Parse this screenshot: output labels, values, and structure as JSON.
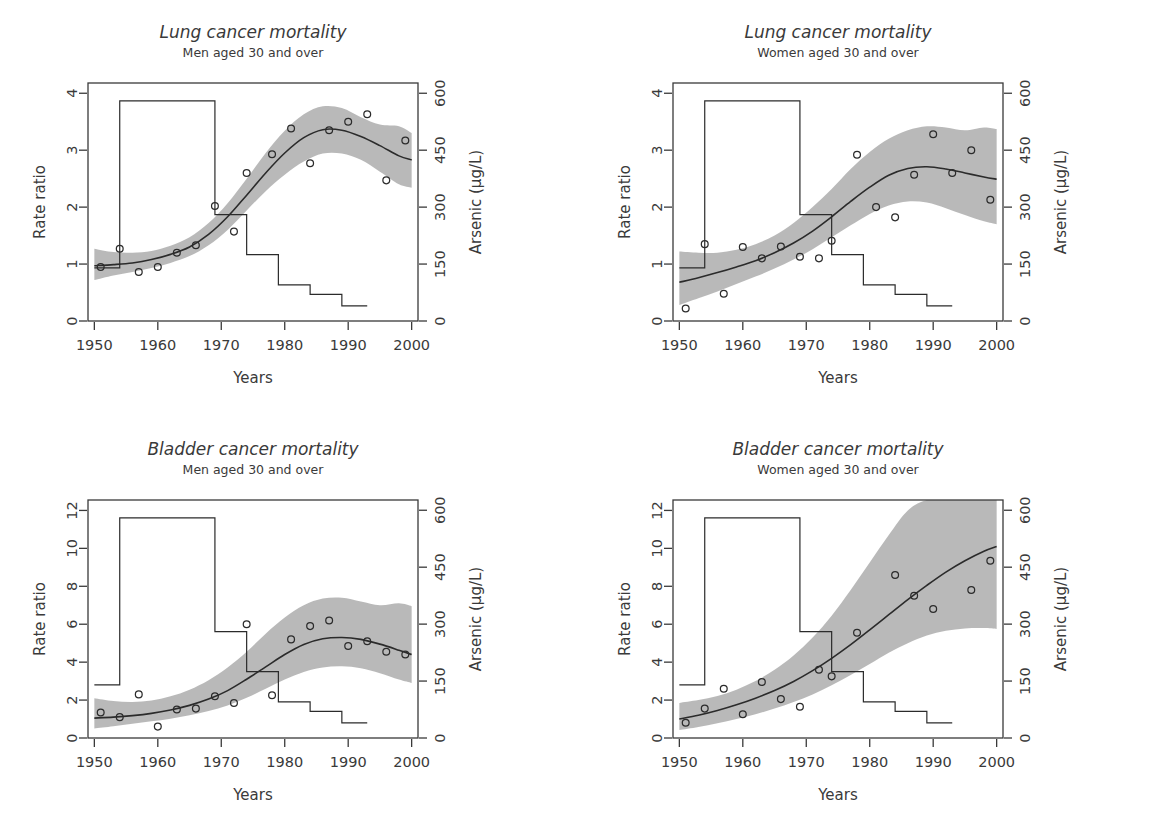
{
  "figure": {
    "background": "#ffffff",
    "band_color": "#b3b3b3",
    "line_color": "#2b2b2b",
    "text_color": "#3a3a3a",
    "width": 1169,
    "height": 834
  },
  "chart_data": [
    {
      "id": "lung-men",
      "type": "line",
      "title": "Lung cancer mortality",
      "subtitle": "Men aged 30 and over",
      "xlabel": "Years",
      "ylabel": "Rate ratio",
      "y2label": "Arsenic (µg/L)",
      "xlim": [
        1949,
        2001
      ],
      "ylim": [
        0,
        4.18
      ],
      "y2lim": [
        0,
        627
      ],
      "xticks": [
        1950,
        1960,
        1970,
        1980,
        1990,
        2000
      ],
      "yticks": [
        0,
        1,
        2,
        3,
        4
      ],
      "y2ticks": [
        0,
        150,
        300,
        450,
        600
      ],
      "grid": false,
      "legend": "none",
      "series": [
        {
          "name": "Observed rate ratio",
          "type": "scatter",
          "x": [
            1951,
            1954,
            1957,
            1960,
            1963,
            1966,
            1969,
            1972,
            1974,
            1978,
            1981,
            1984,
            1987,
            1990,
            1993,
            1996,
            1999
          ],
          "y": [
            0.95,
            1.27,
            0.86,
            0.95,
            1.2,
            1.33,
            2.02,
            1.57,
            2.6,
            2.93,
            3.38,
            2.77,
            3.35,
            3.5,
            3.63,
            2.47,
            3.17
          ]
        },
        {
          "name": "Fitted rate ratio",
          "type": "line",
          "x": [
            1950,
            1953,
            1956,
            1959,
            1962,
            1965,
            1968,
            1971,
            1974,
            1977,
            1980,
            1983,
            1986,
            1989,
            1992,
            1995,
            1998,
            2000
          ],
          "y": [
            0.97,
            0.99,
            1.02,
            1.08,
            1.17,
            1.3,
            1.52,
            1.83,
            2.21,
            2.6,
            2.95,
            3.22,
            3.36,
            3.35,
            3.24,
            3.08,
            2.9,
            2.83
          ]
        },
        {
          "name": "95% confidence band (upper)",
          "type": "band_upper",
          "x": [
            1950,
            1953,
            1956,
            1959,
            1962,
            1965,
            1968,
            1971,
            1974,
            1977,
            1980,
            1983,
            1986,
            1989,
            1992,
            1995,
            1998,
            2000
          ],
          "y": [
            1.27,
            1.21,
            1.2,
            1.23,
            1.32,
            1.47,
            1.72,
            2.07,
            2.5,
            2.95,
            3.34,
            3.63,
            3.77,
            3.74,
            3.58,
            3.45,
            3.42,
            3.3
          ]
        },
        {
          "name": "95% confidence band (lower)",
          "type": "band_lower",
          "x": [
            1950,
            1953,
            1956,
            1959,
            1962,
            1965,
            1968,
            1971,
            1974,
            1977,
            1980,
            1983,
            1986,
            1989,
            1992,
            1995,
            1998,
            2000
          ],
          "y": [
            0.72,
            0.8,
            0.86,
            0.93,
            1.02,
            1.14,
            1.33,
            1.6,
            1.94,
            2.28,
            2.57,
            2.8,
            2.94,
            2.94,
            2.83,
            2.62,
            2.4,
            2.34
          ]
        },
        {
          "name": "Arsenic concentration",
          "type": "step",
          "axis": "y2",
          "x": [
            1950,
            1954,
            1954,
            1969,
            1969,
            1974,
            1974,
            1979,
            1979,
            1984,
            1984,
            1989,
            1989,
            1993
          ],
          "y": [
            140,
            140,
            580,
            580,
            280,
            280,
            175,
            175,
            95,
            95,
            70,
            70,
            40,
            40
          ]
        }
      ]
    },
    {
      "id": "lung-women",
      "type": "line",
      "title": "Lung cancer mortality",
      "subtitle": "Women aged 30 and over",
      "xlabel": "Years",
      "ylabel": "Rate ratio",
      "y2label": "Arsenic (µg/L)",
      "xlim": [
        1949,
        2001
      ],
      "ylim": [
        0,
        4.18
      ],
      "y2lim": [
        0,
        627
      ],
      "xticks": [
        1950,
        1960,
        1970,
        1980,
        1990,
        2000
      ],
      "yticks": [
        0,
        1,
        2,
        3,
        4
      ],
      "y2ticks": [
        0,
        150,
        300,
        450,
        600
      ],
      "grid": false,
      "legend": "none",
      "series": [
        {
          "name": "Observed rate ratio",
          "type": "scatter",
          "x": [
            1951,
            1954,
            1957,
            1960,
            1963,
            1966,
            1969,
            1972,
            1974,
            1978,
            1981,
            1984,
            1987,
            1990,
            1993,
            1996,
            1999
          ],
          "y": [
            0.22,
            1.35,
            0.48,
            1.3,
            1.1,
            1.31,
            1.13,
            1.1,
            1.41,
            2.92,
            2.0,
            1.82,
            2.57,
            3.28,
            2.6,
            3.0,
            2.13
          ]
        },
        {
          "name": "Fitted rate ratio",
          "type": "line",
          "x": [
            1950,
            1953,
            1956,
            1959,
            1962,
            1965,
            1968,
            1971,
            1974,
            1977,
            1980,
            1983,
            1986,
            1989,
            1992,
            1995,
            1998,
            2000
          ],
          "y": [
            0.68,
            0.76,
            0.85,
            0.95,
            1.06,
            1.2,
            1.37,
            1.58,
            1.83,
            2.1,
            2.35,
            2.56,
            2.68,
            2.71,
            2.67,
            2.6,
            2.53,
            2.49
          ]
        },
        {
          "name": "95% confidence band (upper)",
          "type": "band_upper",
          "x": [
            1950,
            1953,
            1956,
            1959,
            1962,
            1965,
            1968,
            1971,
            1974,
            1977,
            1980,
            1983,
            1986,
            1989,
            1992,
            1995,
            1998,
            2000
          ],
          "y": [
            1.22,
            1.2,
            1.2,
            1.25,
            1.35,
            1.5,
            1.72,
            2.0,
            2.32,
            2.67,
            2.97,
            3.2,
            3.35,
            3.42,
            3.4,
            3.35,
            3.4,
            3.37
          ]
        },
        {
          "name": "95% confidence band (lower)",
          "type": "band_lower",
          "x": [
            1950,
            1953,
            1956,
            1959,
            1962,
            1965,
            1968,
            1971,
            1974,
            1977,
            1980,
            1983,
            1986,
            1989,
            1992,
            1995,
            1998,
            2000
          ],
          "y": [
            0.28,
            0.4,
            0.52,
            0.65,
            0.78,
            0.92,
            1.08,
            1.26,
            1.47,
            1.68,
            1.88,
            2.03,
            2.1,
            2.08,
            1.98,
            1.86,
            1.75,
            1.7
          ]
        },
        {
          "name": "Arsenic concentration",
          "type": "step",
          "axis": "y2",
          "x": [
            1950,
            1954,
            1954,
            1969,
            1969,
            1974,
            1974,
            1979,
            1979,
            1984,
            1984,
            1989,
            1989,
            1993
          ],
          "y": [
            140,
            140,
            580,
            580,
            280,
            280,
            175,
            175,
            95,
            95,
            70,
            70,
            40,
            40
          ]
        }
      ]
    },
    {
      "id": "bladder-men",
      "type": "line",
      "title": "Bladder cancer mortality",
      "subtitle": "Men aged 30 and over",
      "xlabel": "Years",
      "ylabel": "Rate ratio",
      "y2label": "Arsenic (µg/L)",
      "xlim": [
        1949,
        2001
      ],
      "ylim": [
        0,
        12.55
      ],
      "y2lim": [
        0,
        627
      ],
      "xticks": [
        1950,
        1960,
        1970,
        1980,
        1990,
        2000
      ],
      "yticks": [
        0,
        2,
        4,
        6,
        8,
        10,
        12
      ],
      "y2ticks": [
        0,
        150,
        300,
        450,
        600
      ],
      "grid": false,
      "legend": "none",
      "series": [
        {
          "name": "Observed rate ratio",
          "type": "scatter",
          "x": [
            1951,
            1954,
            1957,
            1960,
            1963,
            1966,
            1969,
            1972,
            1974,
            1978,
            1981,
            1984,
            1987,
            1990,
            1993,
            1996,
            1999
          ],
          "y": [
            1.35,
            1.1,
            2.3,
            0.6,
            1.5,
            1.55,
            2.2,
            1.85,
            6.0,
            2.25,
            5.2,
            5.9,
            6.2,
            4.85,
            5.1,
            4.55,
            4.4
          ]
        },
        {
          "name": "Fitted rate ratio",
          "type": "line",
          "x": [
            1950,
            1953,
            1956,
            1959,
            1962,
            1965,
            1968,
            1971,
            1974,
            1977,
            1980,
            1983,
            1986,
            1989,
            1992,
            1995,
            1998,
            2000
          ],
          "y": [
            1.05,
            1.1,
            1.18,
            1.3,
            1.48,
            1.72,
            2.05,
            2.5,
            3.1,
            3.75,
            4.4,
            4.93,
            5.23,
            5.3,
            5.2,
            4.95,
            4.63,
            4.4
          ]
        },
        {
          "name": "95% confidence band (upper)",
          "type": "band_upper",
          "x": [
            1950,
            1953,
            1956,
            1959,
            1962,
            1965,
            1968,
            1971,
            1974,
            1977,
            1980,
            1983,
            1986,
            1989,
            1992,
            1995,
            1998,
            2000
          ],
          "y": [
            2.1,
            1.95,
            1.9,
            1.98,
            2.2,
            2.55,
            3.05,
            3.72,
            4.55,
            5.5,
            6.35,
            7.0,
            7.35,
            7.4,
            7.2,
            7.0,
            7.1,
            6.95
          ]
        },
        {
          "name": "95% confidence band (lower)",
          "type": "band_lower",
          "x": [
            1950,
            1953,
            1956,
            1959,
            1962,
            1965,
            1968,
            1971,
            1974,
            1977,
            1980,
            1983,
            1986,
            1989,
            1992,
            1995,
            1998,
            2000
          ],
          "y": [
            0.5,
            0.62,
            0.75,
            0.88,
            1.02,
            1.2,
            1.42,
            1.72,
            2.12,
            2.6,
            3.08,
            3.48,
            3.72,
            3.78,
            3.68,
            3.42,
            3.08,
            2.9
          ]
        },
        {
          "name": "Arsenic concentration",
          "type": "step",
          "axis": "y2",
          "x": [
            1950,
            1954,
            1954,
            1969,
            1969,
            1974,
            1974,
            1979,
            1979,
            1984,
            1984,
            1989,
            1989,
            1993
          ],
          "y": [
            140,
            140,
            580,
            580,
            280,
            280,
            175,
            175,
            95,
            95,
            70,
            70,
            40,
            40
          ]
        }
      ]
    },
    {
      "id": "bladder-women",
      "type": "line",
      "title": "Bladder cancer mortality",
      "subtitle": "Women aged 30 and over",
      "xlabel": "Years",
      "ylabel": "Rate ratio",
      "y2label": "Arsenic (µg/L)",
      "xlim": [
        1949,
        2001
      ],
      "ylim": [
        0,
        12.55
      ],
      "y2lim": [
        0,
        627
      ],
      "xticks": [
        1950,
        1960,
        1970,
        1980,
        1990,
        2000
      ],
      "yticks": [
        0,
        2,
        4,
        6,
        8,
        10,
        12
      ],
      "y2ticks": [
        0,
        150,
        300,
        450,
        600
      ],
      "grid": false,
      "legend": "none",
      "series": [
        {
          "name": "Observed rate ratio",
          "type": "scatter",
          "x": [
            1951,
            1954,
            1957,
            1960,
            1963,
            1966,
            1969,
            1972,
            1974,
            1978,
            1984,
            1987,
            1990,
            1996,
            1999
          ],
          "y": [
            0.8,
            1.55,
            2.6,
            1.25,
            2.95,
            2.05,
            1.65,
            3.6,
            3.25,
            5.55,
            8.6,
            7.5,
            6.8,
            7.8,
            9.35
          ]
        },
        {
          "name": "Fitted rate ratio",
          "type": "line",
          "x": [
            1950,
            1953,
            1956,
            1959,
            1962,
            1965,
            1968,
            1971,
            1974,
            1977,
            1980,
            1983,
            1986,
            1989,
            1992,
            1995,
            1998,
            2000
          ],
          "y": [
            1.0,
            1.2,
            1.45,
            1.75,
            2.1,
            2.5,
            2.98,
            3.55,
            4.2,
            4.92,
            5.7,
            6.5,
            7.3,
            8.05,
            8.75,
            9.35,
            9.85,
            10.1
          ]
        },
        {
          "name": "95% confidence band (upper)",
          "type": "band_upper",
          "x": [
            1950,
            1953,
            1956,
            1959,
            1962,
            1965,
            1968,
            1971,
            1974,
            1977,
            1980,
            1983,
            1986,
            1989,
            1992,
            1995,
            1998,
            2000
          ],
          "y": [
            1.85,
            2.0,
            2.22,
            2.55,
            3.0,
            3.6,
            4.35,
            5.3,
            6.45,
            7.8,
            9.25,
            10.7,
            12.0,
            12.55,
            12.55,
            12.55,
            12.55,
            12.55
          ]
        },
        {
          "name": "95% confidence band (lower)",
          "type": "band_lower",
          "x": [
            1950,
            1953,
            1956,
            1959,
            1962,
            1965,
            1968,
            1971,
            1974,
            1977,
            1980,
            1983,
            1986,
            1989,
            1992,
            1995,
            1998,
            2000
          ],
          "y": [
            0.42,
            0.58,
            0.78,
            1.0,
            1.25,
            1.55,
            1.9,
            2.3,
            2.78,
            3.32,
            3.9,
            4.5,
            5.0,
            5.4,
            5.65,
            5.78,
            5.8,
            5.75
          ]
        },
        {
          "name": "Arsenic concentration",
          "type": "step",
          "axis": "y2",
          "x": [
            1950,
            1954,
            1954,
            1969,
            1969,
            1974,
            1974,
            1979,
            1979,
            1984,
            1984,
            1989,
            1989,
            1993
          ],
          "y": [
            140,
            140,
            580,
            580,
            280,
            280,
            175,
            175,
            95,
            95,
            70,
            70,
            40,
            40
          ]
        }
      ]
    }
  ]
}
